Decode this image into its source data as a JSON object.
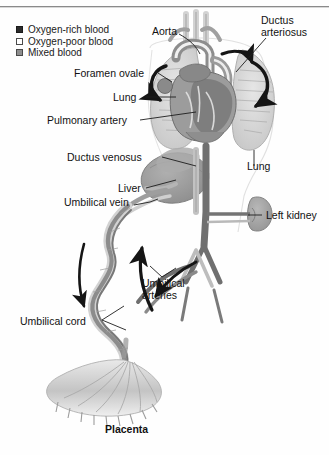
{
  "figure": {
    "caption": "Placenta",
    "background": "#ffffff",
    "ink": "#1d1d1d"
  },
  "legend": {
    "items": [
      {
        "label": "Oxygen-rich blood",
        "swatch": "rich",
        "color": "#2b2b2b"
      },
      {
        "label": "Oxygen-poor blood",
        "swatch": "poor",
        "color": "#ffffff"
      },
      {
        "label": "Mixed blood",
        "swatch": "mixed",
        "color": "#8e8e8e"
      }
    ]
  },
  "labels": {
    "aorta": "Aorta",
    "ductus_arteriosus_1": "Ductus",
    "ductus_arteriosus_2": "arteriosus",
    "foramen_ovale": "Foramen ovale",
    "lung_left": "Lung",
    "pulmonary_artery": "Pulmonary artery",
    "ductus_venosus": "Ductus venosus",
    "liver": "Liver",
    "umbilical_vein": "Umbilical vein",
    "lung_right": "Lung",
    "left_kidney": "Left kidney",
    "umbilical_arteries_1": "Umbilical",
    "umbilical_arteries_2": "arteries",
    "umbilical_cord": "Umbilical cord",
    "placenta": "Placenta"
  },
  "colors": {
    "lung_fill": "#d9d9d9",
    "lung_edge": "#9a9a9a",
    "heart_mid": "#a8a8a8",
    "heart_dark": "#6f6f6f",
    "liver_fill": "#9d9d9d",
    "kidney_fill": "#a5a5a5",
    "vessel_dark": "#707070",
    "vessel_light": "#cfcfcf",
    "placenta_fill": "#c9c9c9",
    "arrow": "#151515"
  }
}
